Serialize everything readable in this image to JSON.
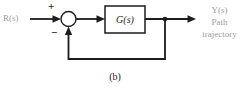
{
  "diagram": {
    "input_label": "R(s)",
    "sum_plus": "+",
    "sum_minus": "−",
    "block_label": "G(s)",
    "output_label": "Y(s)",
    "output_desc_line1": "Path",
    "output_desc_line2": "trajectory",
    "caption": "(b)"
  },
  "colors": {
    "line": "#1c1c1c",
    "muted_label": "#9e9e9e",
    "background": "#ffffff"
  }
}
